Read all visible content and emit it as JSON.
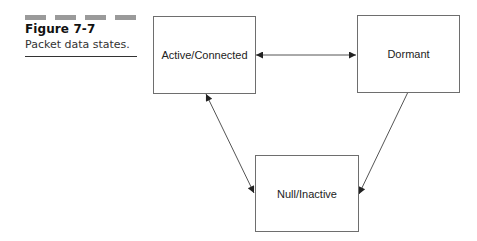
{
  "figure": {
    "label": "Figure 7-7",
    "caption": "Packet data states.",
    "decoration_bar_color": "#9a9a9a",
    "decoration_bar_count": 4
  },
  "diagram": {
    "type": "state-diagram",
    "nodes": [
      {
        "id": "active",
        "label": "Active/Connected"
      },
      {
        "id": "dormant",
        "label": "Dormant"
      },
      {
        "id": "null",
        "label": "Null/Inactive"
      }
    ],
    "edges": [
      {
        "from": "active",
        "to": "dormant",
        "direction": "bidirectional"
      },
      {
        "from": "active",
        "to": "null",
        "direction": "bidirectional"
      },
      {
        "from": "dormant",
        "to": "null",
        "direction": "unidirectional"
      }
    ],
    "colors": {
      "box_border": "#6e6e6e",
      "edge": "#555555",
      "arrowhead": "#222222"
    }
  }
}
